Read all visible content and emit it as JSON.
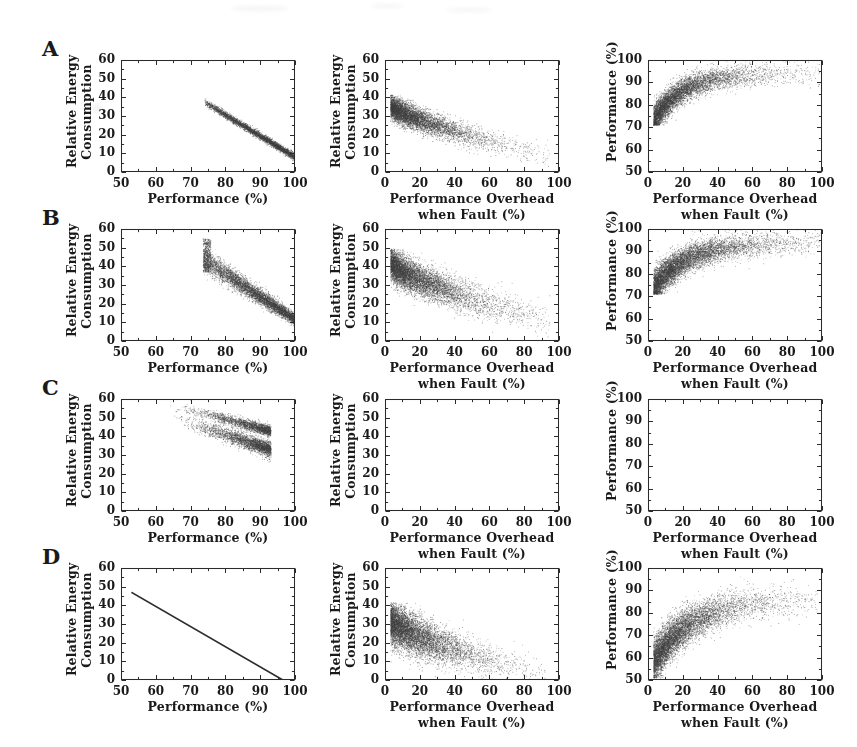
{
  "figure": {
    "width": 857,
    "height": 747,
    "background": "#ffffff",
    "ink_color": "#2b2b2b",
    "point_color": "#4a4a4a",
    "rows": [
      "A",
      "B",
      "C",
      "D"
    ],
    "columns": 3
  },
  "axis_titles": {
    "energy_y": "Relative Energy\nConsumption",
    "energy_y_line1": "Relative Energy",
    "energy_y_line2": "Consumption",
    "performance_y": "Performance (%)",
    "performance_x": "Performance (%)",
    "overhead_x_line1": "Performance Overhead",
    "overhead_x_line2": "when Fault (%)"
  },
  "ticks": {
    "performance_axis": [
      "50",
      "60",
      "70",
      "80",
      "90",
      "100"
    ],
    "energy_axis": [
      "0",
      "10",
      "20",
      "30",
      "40",
      "50",
      "60"
    ],
    "overhead_axis": [
      "0",
      "20",
      "40",
      "60",
      "80",
      "100"
    ],
    "performance_y_axis": [
      "50",
      "60",
      "70",
      "80",
      "90",
      "100"
    ]
  },
  "chart_data": [
    {
      "id": "A-left",
      "row": "A",
      "column": 1,
      "type": "scatter",
      "title": "",
      "xlabel": "Performance (%)",
      "ylabel": "Relative Energy Consumption",
      "xlim": [
        50,
        100
      ],
      "ylim": [
        0,
        60
      ],
      "xticks": [
        50,
        60,
        70,
        80,
        90,
        100
      ],
      "yticks": [
        0,
        10,
        20,
        30,
        40,
        50,
        60
      ],
      "grid": false,
      "legend": "none",
      "n_points": 4000,
      "cloud": {
        "shape": "tight-descending-band",
        "x_range": [
          74,
          100.5
        ],
        "y_at_xmin": 37.5,
        "y_at_xmax": 7.5,
        "band_thickness": 2.2,
        "density_peak_x": 90
      },
      "description": "Narrow dense band decreasing linearly from about (74, 37) to (100, 8)."
    },
    {
      "id": "A-middle",
      "row": "A",
      "column": 2,
      "type": "scatter",
      "title": "",
      "xlabel": "Performance Overhead when Fault (%)",
      "ylabel": "Relative Energy Consumption",
      "xlim": [
        0,
        100
      ],
      "ylim": [
        0,
        60
      ],
      "xticks": [
        0,
        20,
        40,
        60,
        80,
        100
      ],
      "yticks": [
        0,
        10,
        20,
        30,
        40,
        50,
        60
      ],
      "grid": false,
      "legend": "none",
      "n_points": 6000,
      "cloud": {
        "shape": "decaying-wedge",
        "x_range": [
          3,
          95
        ],
        "y_at_xmin": 36,
        "y_at_xmax": 9,
        "spread_at_xmin": 5,
        "spread_at_xmax": 5,
        "density_decay": 0.055,
        "density_peak_x": 14
      },
      "description": "Dense wedge starting near (5, 36) falling to about (60, 10), sparse tail out to 95."
    },
    {
      "id": "A-right",
      "row": "A",
      "column": 3,
      "type": "scatter",
      "title": "",
      "xlabel": "Performance Overhead when Fault (%)",
      "ylabel": "Performance (%)",
      "xlim": [
        0,
        100
      ],
      "ylim": [
        50,
        100
      ],
      "xticks": [
        0,
        20,
        40,
        60,
        80,
        100
      ],
      "yticks": [
        50,
        60,
        70,
        80,
        90,
        100
      ],
      "grid": false,
      "legend": "none",
      "n_points": 6000,
      "cloud": {
        "shape": "rising-saturating",
        "x_range": [
          3,
          99
        ],
        "y_at_xmin": 73,
        "y_plateau": 94,
        "rise_rate": 0.06,
        "spread": 5.5,
        "y_floor": 71,
        "density_decay": 0.05,
        "density_peak_x": 26
      },
      "description": "Cloud rising from about (4, 73) saturating near 90-97 for overhead above 30, sharp floor at 71."
    },
    {
      "id": "B-left",
      "row": "B",
      "column": 1,
      "type": "scatter",
      "title": "",
      "xlabel": "Performance (%)",
      "ylabel": "Relative Energy Consumption",
      "xlim": [
        50,
        100
      ],
      "ylim": [
        0,
        60
      ],
      "xticks": [
        50,
        60,
        70,
        80,
        90,
        100
      ],
      "yticks": [
        0,
        10,
        20,
        30,
        40,
        50,
        60
      ],
      "grid": false,
      "legend": "none",
      "n_points": 6000,
      "cloud": {
        "shape": "wide-descending-band",
        "x_range": [
          73.5,
          100.5
        ],
        "y_at_xmin": 44,
        "y_at_xmax": 11,
        "band_thickness": 7.0,
        "left_edge_vertical": true,
        "left_edge_span": [
          37,
          55
        ],
        "density_peak_x": 88
      },
      "description": "Broad descending band from a vertical left edge at x=74 spanning 37-55 down to about (100, 10)."
    },
    {
      "id": "B-middle",
      "row": "B",
      "column": 2,
      "type": "scatter",
      "title": "",
      "xlabel": "Performance Overhead when Fault (%)",
      "ylabel": "Relative Energy Consumption",
      "xlim": [
        0,
        100
      ],
      "ylim": [
        0,
        60
      ],
      "xticks": [
        0,
        20,
        40,
        60,
        80,
        100
      ],
      "yticks": [
        0,
        10,
        20,
        30,
        40,
        50,
        60
      ],
      "grid": false,
      "legend": "none",
      "n_points": 7000,
      "cloud": {
        "shape": "decaying-wedge",
        "x_range": [
          3,
          95
        ],
        "y_at_xmin": 42,
        "y_at_xmax": 11,
        "spread_at_xmin": 7,
        "spread_at_xmax": 7,
        "density_decay": 0.05,
        "density_peak_x": 16
      },
      "description": "Dense wedge from about (4, 43) decaying to (60, 13) with thin tail to 95."
    },
    {
      "id": "B-right",
      "row": "B",
      "column": 3,
      "type": "scatter",
      "title": "",
      "xlabel": "Performance Overhead when Fault (%)",
      "ylabel": "Performance (%)",
      "xlim": [
        0,
        100
      ],
      "ylim": [
        50,
        100
      ],
      "xticks": [
        0,
        20,
        40,
        60,
        80,
        100
      ],
      "yticks": [
        50,
        60,
        70,
        80,
        90,
        100
      ],
      "grid": false,
      "legend": "none",
      "n_points": 7000,
      "cloud": {
        "shape": "rising-saturating",
        "x_range": [
          3,
          99
        ],
        "y_at_xmin": 74,
        "y_plateau": 94,
        "rise_rate": 0.05,
        "spread": 6.0,
        "y_floor": 71,
        "density_decay": 0.045,
        "density_peak_x": 24
      },
      "description": "Cloud rising from (4, 74) toward 92-97 plateau, hard floor at 71."
    },
    {
      "id": "C-left",
      "row": "C",
      "column": 1,
      "type": "scatter",
      "title": "",
      "xlabel": "Performance (%)",
      "ylabel": "Relative Energy Consumption",
      "xlim": [
        50,
        100
      ],
      "ylim": [
        0,
        60
      ],
      "xticks": [
        50,
        60,
        70,
        80,
        90,
        100
      ],
      "yticks": [
        0,
        10,
        20,
        30,
        40,
        50,
        60
      ],
      "grid": false,
      "legend": "none",
      "n_points": 5000,
      "cloud": {
        "shape": "two-descending-bands-clipped",
        "x_range": [
          62,
          93
        ],
        "upper_band": {
          "y_at_xmin": 58,
          "y_at_xmax": 43,
          "thickness": 3.2
        },
        "lower_band": {
          "y_at_xmin": 52,
          "y_at_xmax": 33,
          "thickness": 4.5
        },
        "right_clip_x": 93,
        "density_peak_x": 87
      },
      "description": "Two overlapping descending bands between x=62 and x=93, energy 33-58, densest near x=85-92, nothing beyond x=93."
    },
    {
      "id": "C-middle",
      "row": "C",
      "column": 2,
      "type": "scatter",
      "title": "",
      "xlabel": "Performance Overhead when Fault (%)",
      "ylabel": "Relative Energy Consumption",
      "xlim": [
        0,
        100
      ],
      "ylim": [
        0,
        60
      ],
      "xticks": [
        0,
        20,
        40,
        60,
        80,
        100
      ],
      "yticks": [
        0,
        10,
        20,
        30,
        40,
        50,
        60
      ],
      "grid": false,
      "legend": "none",
      "n_points": 0,
      "cloud": {
        "shape": "empty"
      },
      "description": "Empty axes - no data plotted."
    },
    {
      "id": "C-right",
      "row": "C",
      "column": 3,
      "type": "scatter",
      "title": "",
      "xlabel": "Performance Overhead when Fault (%)",
      "ylabel": "Performance (%)",
      "xlim": [
        0,
        100
      ],
      "ylim": [
        50,
        100
      ],
      "xticks": [
        0,
        20,
        40,
        60,
        80,
        100
      ],
      "yticks": [
        50,
        60,
        70,
        80,
        90,
        100
      ],
      "grid": false,
      "legend": "none",
      "n_points": 0,
      "cloud": {
        "shape": "empty"
      },
      "description": "Empty axes - no data plotted."
    },
    {
      "id": "D-left",
      "row": "D",
      "column": 1,
      "type": "line",
      "title": "",
      "xlabel": "Performance (%)",
      "ylabel": "Relative Energy Consumption",
      "xlim": [
        50,
        100
      ],
      "ylim": [
        0,
        60
      ],
      "xticks": [
        50,
        60,
        70,
        80,
        90,
        100
      ],
      "yticks": [
        0,
        10,
        20,
        30,
        40,
        50,
        60
      ],
      "grid": false,
      "legend": "none",
      "x": [
        53,
        96.5
      ],
      "y": [
        47,
        0
      ],
      "line_width": 1.6,
      "description": "Single straight descending line from (53, 47) to (96.5, 0)."
    },
    {
      "id": "D-middle",
      "row": "D",
      "column": 2,
      "type": "scatter",
      "title": "",
      "xlabel": "Performance Overhead when Fault (%)",
      "ylabel": "Relative Energy Consumption",
      "xlim": [
        0,
        100
      ],
      "ylim": [
        0,
        60
      ],
      "xticks": [
        0,
        20,
        40,
        60,
        80,
        100
      ],
      "yticks": [
        0,
        10,
        20,
        30,
        40,
        50,
        60
      ],
      "grid": false,
      "legend": "none",
      "n_points": 7000,
      "cloud": {
        "shape": "decaying-wedge",
        "x_range": [
          3,
          92
        ],
        "y_at_xmin": 32,
        "y_at_xmax": 3,
        "spread_at_xmin": 9,
        "spread_at_xmax": 6,
        "density_decay": 0.055,
        "density_peak_x": 16
      },
      "description": "Broad wedge from about (5, 33) descending to (60, 4), thin tail to 92, clipped at y=0."
    },
    {
      "id": "D-right",
      "row": "D",
      "column": 3,
      "type": "scatter",
      "title": "",
      "xlabel": "Performance Overhead when Fault (%)",
      "ylabel": "Performance (%)",
      "xlim": [
        0,
        100
      ],
      "ylim": [
        50,
        100
      ],
      "xticks": [
        0,
        20,
        40,
        60,
        80,
        100
      ],
      "yticks": [
        50,
        60,
        70,
        80,
        90,
        100
      ],
      "grid": false,
      "legend": "none",
      "n_points": 7000,
      "cloud": {
        "shape": "rising-saturating",
        "x_range": [
          3,
          97
        ],
        "y_at_xmin": 58,
        "y_plateau": 86,
        "rise_rate": 0.045,
        "spread": 8.0,
        "y_floor": 51,
        "density_decay": 0.05,
        "density_peak_x": 24
      },
      "description": "Cloud rising from about (4, 57) to a plateau near 82-92 beyond overhead 50, floor near 51."
    }
  ]
}
